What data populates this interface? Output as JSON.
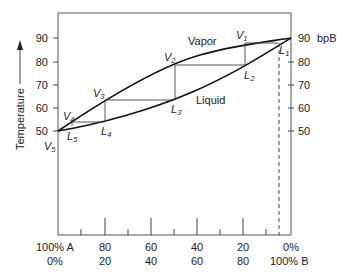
{
  "diagram": {
    "y_axis": {
      "label": "Temperature",
      "left_ticks": [
        "90",
        "80",
        "70",
        "60",
        "50"
      ],
      "right_ticks": [
        "90",
        "80",
        "70",
        "60",
        "50"
      ],
      "right_top_annotation": "bpB"
    },
    "x_axis": {
      "row1": [
        "100% A",
        "80",
        "60",
        "40",
        "20",
        "0%"
      ],
      "row2": [
        "0%",
        "20",
        "40",
        "60",
        "80",
        "100% B"
      ]
    },
    "curves": {
      "vapor_label": "Vapor",
      "liquid_label": "Liquid"
    },
    "points": {
      "V1": {
        "letter": "V",
        "sub": "1"
      },
      "V2": {
        "letter": "V",
        "sub": "2"
      },
      "V3": {
        "letter": "V",
        "sub": "3"
      },
      "V4": {
        "letter": "V",
        "sub": "4"
      },
      "V5": {
        "letter": "V",
        "sub": "5"
      },
      "L1": {
        "letter": "L",
        "sub": "1"
      },
      "L2": {
        "letter": "L",
        "sub": "2"
      },
      "L3": {
        "letter": "L",
        "sub": "3"
      },
      "L4": {
        "letter": "L",
        "sub": "4"
      },
      "L5": {
        "letter": "L",
        "sub": "5"
      }
    }
  }
}
